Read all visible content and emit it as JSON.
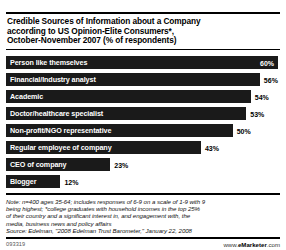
{
  "chart_data": {
    "type": "bar",
    "title": "Credible Sources of Information about a Company according to US Opinion-Elite Consumers*, October-November 2007 (% of respondents)",
    "title_lines": [
      "Credible Sources of Information about a Company",
      "according to US Opinion-Elite Consumers*,",
      "October-November 2007 (% of respondents)"
    ],
    "orientation": "horizontal",
    "categories": [
      "Person like themselves",
      "Financial/Industry analyst",
      "Academic",
      "Doctor/healthcare specialist",
      "Non-profit/NGO representative",
      "Regular employee of company",
      "CEO of company",
      "Blogger"
    ],
    "values": [
      60,
      56,
      54,
      53,
      50,
      43,
      23,
      12
    ],
    "value_labels": [
      "60%",
      "56%",
      "54%",
      "53%",
      "50%",
      "43%",
      "23%",
      "12%"
    ],
    "label_inside_bar": [
      true,
      false,
      false,
      false,
      false,
      false,
      false,
      false
    ],
    "xlabel": "",
    "ylabel": "",
    "xlim": [
      0,
      60
    ],
    "grid": false,
    "legend": null,
    "bar_color": "#1a1a1a",
    "bar_label_color": "#ffffff",
    "value_color": "#000000",
    "background": "#ffffff"
  },
  "notes": {
    "lines": [
      "Note: n=400 ages 35-64; includes responses of 6-9 on a scale of 1-9 with 9",
      "being highest; *college graduates with household incomes in the top 25%",
      "of their country and a significant interest in, and engagement with, the",
      "media, business news and policy affairs"
    ]
  },
  "source": {
    "text": "Source: Edelman, \"2008 Edelman Trust Barometer,\" January 22, 2008"
  },
  "footer": {
    "id": "093319",
    "url_prefix": "www.",
    "url_brand": "eMarketer",
    "url_suffix": ".com"
  }
}
